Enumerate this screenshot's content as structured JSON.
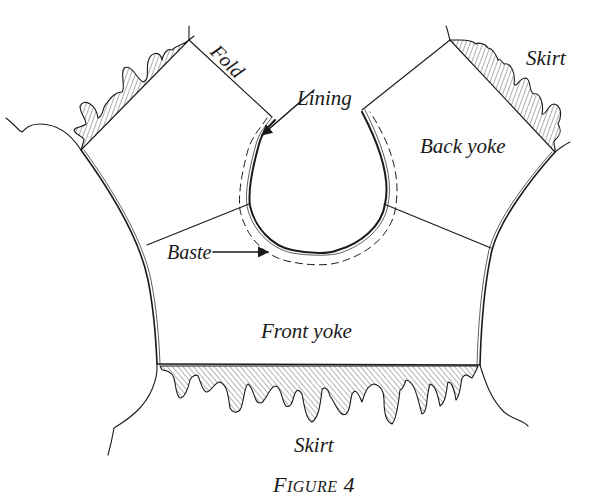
{
  "figure": {
    "caption_prefix": "F",
    "caption_rest": "igure",
    "caption_number": "4",
    "caption_full": "Figure 4"
  },
  "labels": {
    "fold": "Fold",
    "lining": "Lining",
    "back_yoke": "Back yoke",
    "skirt_top": "Skirt",
    "baste": "Baste",
    "front_yoke": "Front yoke",
    "skirt_bottom": "Skirt"
  },
  "colors": {
    "ink": "#1a1a1a",
    "paper": "#ffffff"
  }
}
